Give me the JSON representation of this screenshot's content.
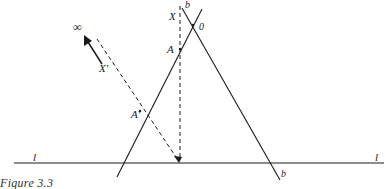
{
  "figure": {
    "caption": "Figure 3.3",
    "labels": {
      "infinity": "∞",
      "x_prime": "X'",
      "x": "X",
      "b_top": "b",
      "o": "0",
      "a": "A",
      "a_prime": "A'",
      "l_left": "l",
      "l_right": "l",
      "b_bottom": "b"
    }
  },
  "colors": {
    "ink": "#1a1a1a",
    "background": "#ffffff"
  }
}
